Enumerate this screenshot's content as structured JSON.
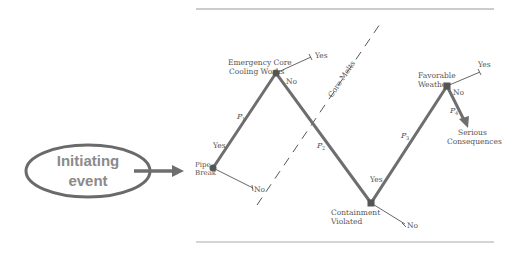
{
  "initiating_event": {
    "label_line1": "Initiating",
    "label_line2": "event"
  },
  "nodes": {
    "pipe_break": {
      "line1": "Pipe",
      "line2": "Break",
      "no": "No",
      "yes": "Yes"
    },
    "eccw": {
      "line1": "Emergency Core",
      "line2": "Cooling Works",
      "yes": "Yes",
      "no": "No"
    },
    "containment": {
      "line1": "Containment",
      "line2": "Violated",
      "yes": "Yes",
      "no": "No"
    },
    "weather": {
      "line1": "Favorable",
      "line2": "Weather",
      "yes": "Yes",
      "no": "No"
    }
  },
  "probabilities": {
    "p1": "P",
    "p1_sub": "1",
    "p2": "P",
    "p2_sub": "2",
    "p3": "P",
    "p3_sub": "3",
    "p4": "P",
    "p4_sub": "4"
  },
  "core_melts_label": "Core Melts",
  "outcome": {
    "line1": "Serious",
    "line2": "Consequences"
  },
  "colors": {
    "path": "#6e6e6e",
    "ellipse_stroke": "#6a6a6a",
    "ellipse_text": "#8a8a8a",
    "node": "#555555",
    "rule": "#999999"
  }
}
